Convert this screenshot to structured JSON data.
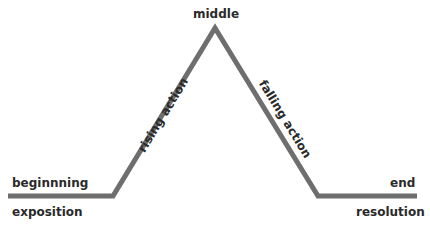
{
  "diagram": {
    "line_color": "#6e6e6e",
    "text_color": "#2a2a2a",
    "points": {
      "start": [
        8,
        196
      ],
      "rise_start": [
        113,
        196
      ],
      "peak": [
        215,
        28
      ],
      "fall_end": [
        318,
        196
      ],
      "end": [
        417,
        196
      ]
    },
    "labels": {
      "beginning": "beginnning",
      "exposition": "exposition",
      "middle": "middle",
      "rising_action": "rising action",
      "falling_action": "falling action",
      "end": "end",
      "resolution": "resolution"
    }
  }
}
